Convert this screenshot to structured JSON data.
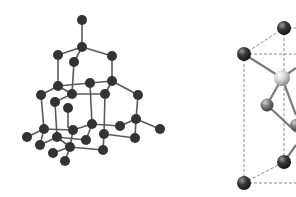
{
  "figure": {
    "panels": [
      {
        "name": "diamond-lattice-ball-and-stick",
        "description": "Extended diamond cubic lattice, ball-and-stick model",
        "atom_color": "#333333",
        "bond_color": "#5a5a5a"
      },
      {
        "name": "unit-cell-detail",
        "description": "Unit cell with dashed cell edges and shaded spheres (partially cropped)",
        "atom_color_dark": "#2f2f2f",
        "atom_color_light": "#d8d8d8",
        "edge_color": "#8a8a8a"
      }
    ]
  }
}
